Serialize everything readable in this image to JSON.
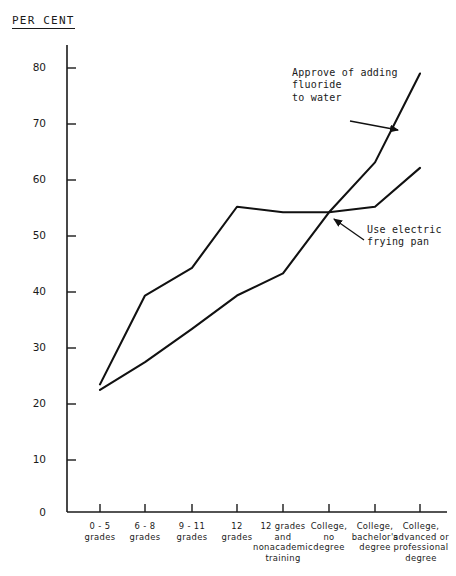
{
  "chart_data": {
    "type": "line",
    "title": "",
    "ylabel": "PER CENT",
    "xlabel": "",
    "ylim": [
      0,
      85
    ],
    "yticks": [
      0,
      10,
      20,
      30,
      40,
      50,
      60,
      70,
      80
    ],
    "ytick_labels": [
      "0",
      "10",
      "20",
      "30",
      "40",
      "50",
      "60",
      "70",
      "80"
    ],
    "grid": false,
    "legend": "annotations-inline",
    "categories": [
      "0 - 5\ngrades",
      "6 - 8\ngrades",
      "9 - 11\ngrades",
      "12\ngrades",
      "12 grades\nand\nnonacademic\ntraining",
      "College,\nno\ndegree",
      "College,\nbachelor's\ndegree",
      "College,\nadvanced or\nprofessional\ndegree"
    ],
    "series": [
      {
        "name": "Approve of adding fluoride to water",
        "values": [
          23,
          39,
          44,
          55,
          54,
          54,
          63,
          79
        ],
        "color": "#111111"
      },
      {
        "name": "Use electric frying pan",
        "values": [
          22,
          27,
          33,
          39,
          43,
          54,
          55,
          62
        ],
        "color": "#111111"
      }
    ],
    "annotations": [
      {
        "name": "fluoride-annotation",
        "text": "Approve of adding\nfluoride\nto water",
        "target_category": "College, advanced or professional degree"
      },
      {
        "name": "frying-pan-annotation",
        "text": "Use electric\nfrying pan",
        "target_category": "College, no degree"
      }
    ]
  }
}
